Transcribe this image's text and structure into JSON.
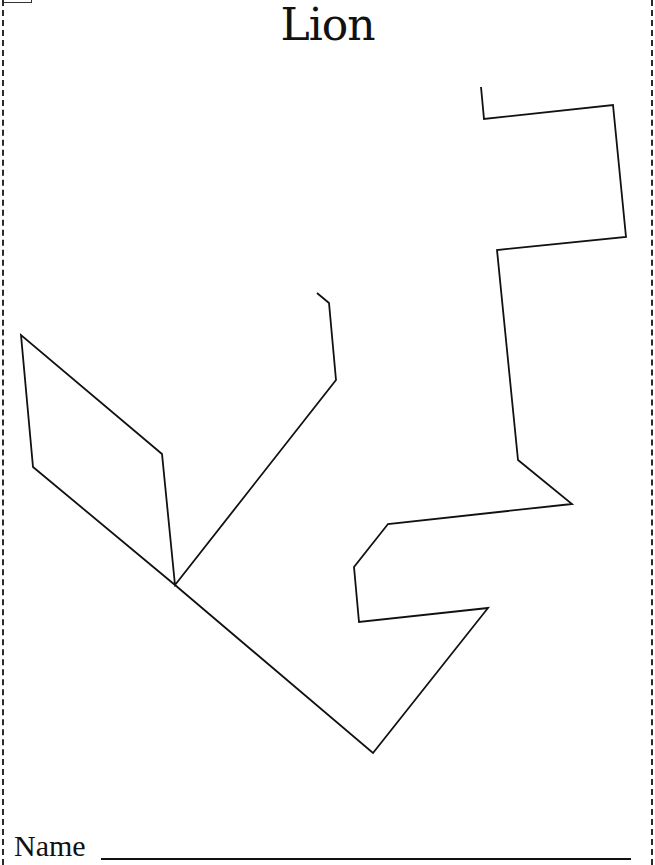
{
  "worksheet": {
    "title": "Lion",
    "name_label": "Name",
    "name_value": ""
  },
  "puzzle": {
    "type": "tangram-outline",
    "stroke_color": "#111111",
    "fill_color": "#ffffff",
    "outline_points": "481,87 484,119 613,105 626,237 497,250 518,460 572,504 388,524 354,567 359,622 488,608 373,753 175,585 33,467 21,335 162,454 175,585 336,380 329,303 317,293"
  },
  "border": {
    "style": "dashed",
    "color": "#2a2a2a"
  }
}
